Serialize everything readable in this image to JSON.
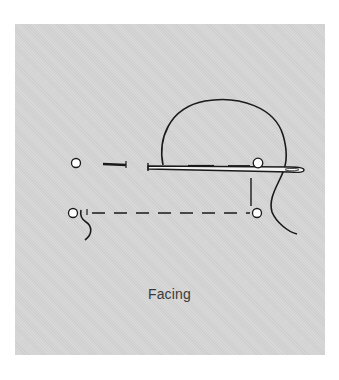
{
  "figure": {
    "caption": "Facing",
    "colors": {
      "background": "#ffffff",
      "panel": "#d6d6d6",
      "ink": "#1a1a1a",
      "caption": "#3a3a3a"
    },
    "elements": {
      "points": [
        {
          "name": "point-top-left",
          "x": 76,
          "y": 163
        },
        {
          "name": "point-top-right",
          "x": 258,
          "y": 163
        },
        {
          "name": "point-bottom-left",
          "x": 73,
          "y": 213
        },
        {
          "name": "point-bottom-right",
          "x": 257,
          "y": 213
        }
      ],
      "needle": {
        "x1": 148,
        "x2": 303,
        "y": 168
      },
      "thread_loop": "loop rising above needle and descending to the right",
      "stitch_lines": [
        "top dashed line",
        "bottom dashed line",
        "vertical dashed connector"
      ]
    }
  }
}
